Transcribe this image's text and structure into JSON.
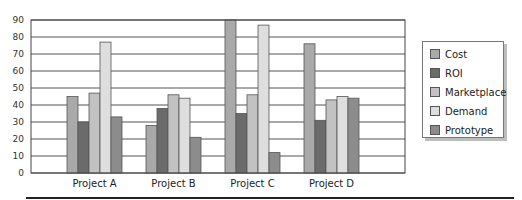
{
  "chart_data": {
    "type": "bar",
    "title": "",
    "xlabel": "",
    "ylabel": "",
    "categories": [
      "Project A",
      "Project B",
      "Project C",
      "Project D"
    ],
    "series": [
      {
        "name": "Cost",
        "color": "#a9a9a9",
        "values": [
          45,
          28,
          90,
          76
        ]
      },
      {
        "name": "ROI",
        "color": "#6b6b6b",
        "values": [
          30,
          38,
          35,
          31
        ]
      },
      {
        "name": "Marketplace",
        "color": "#c2c2c2",
        "values": [
          47,
          46,
          46,
          43
        ]
      },
      {
        "name": "Demand",
        "color": "#dedede",
        "values": [
          77,
          44,
          87,
          45
        ]
      },
      {
        "name": "Prototype",
        "color": "#8c8c8c",
        "values": [
          33,
          21,
          12,
          44
        ]
      }
    ],
    "yticks": [
      0,
      10,
      20,
      30,
      40,
      50,
      60,
      70,
      80,
      90
    ],
    "ylim": [
      0,
      90
    ],
    "grid": true,
    "legend_position": "right"
  }
}
